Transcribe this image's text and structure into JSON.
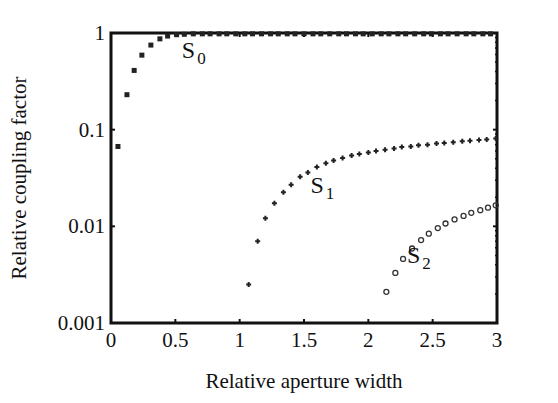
{
  "chart_data": {
    "type": "scatter",
    "title": "",
    "xlabel": "Relative aperture width",
    "ylabel": "Relative coupling factor",
    "xlim": [
      0,
      3
    ],
    "ylim": [
      0.001,
      1
    ],
    "yscale": "log",
    "grid": false,
    "legend": "inline labels",
    "x_ticks": [
      "0",
      "0.5",
      "1",
      "1.5",
      "2",
      "2.5",
      "3"
    ],
    "y_ticks": [
      "0.001",
      "0.01",
      "0.1",
      "1"
    ],
    "annotations": [
      {
        "text": "S",
        "sub": "0",
        "x": 0.55,
        "y": 0.55
      },
      {
        "text": "S",
        "sub": "1",
        "x": 1.55,
        "y": 0.022
      },
      {
        "text": "S",
        "sub": "2",
        "x": 2.3,
        "y": 0.0042
      }
    ],
    "series": [
      {
        "name": "S0",
        "marker": "x",
        "x": [
          0.054,
          0.124,
          0.18,
          0.24,
          0.31,
          0.38,
          0.44,
          0.51,
          0.57,
          0.64,
          0.71,
          0.77,
          0.84,
          0.9,
          0.97,
          1.04,
          1.1,
          1.17,
          1.24,
          1.3,
          1.37,
          1.43,
          1.5,
          1.57,
          1.63,
          1.7,
          1.77,
          1.83,
          1.9,
          1.96,
          2.03,
          2.1,
          2.16,
          2.23,
          2.29,
          2.36,
          2.43,
          2.49,
          2.56,
          2.62,
          2.69,
          2.76,
          2.82,
          2.89,
          2.95
        ],
        "y": [
          0.067,
          0.23,
          0.41,
          0.59,
          0.75,
          0.87,
          0.93,
          0.96,
          0.97,
          0.98,
          0.98,
          0.98,
          0.98,
          0.98,
          0.98,
          0.98,
          0.98,
          0.98,
          0.98,
          0.98,
          0.98,
          0.98,
          0.98,
          0.98,
          0.98,
          0.98,
          0.98,
          0.98,
          0.98,
          0.98,
          0.98,
          0.98,
          0.98,
          0.98,
          0.98,
          0.98,
          0.98,
          0.98,
          0.98,
          0.98,
          0.98,
          0.98,
          0.98,
          0.98,
          0.98
        ]
      },
      {
        "name": "S1",
        "marker": "+",
        "x": [
          1.07,
          1.14,
          1.2,
          1.27,
          1.34,
          1.4,
          1.47,
          1.53,
          1.6,
          1.67,
          1.73,
          1.8,
          1.87,
          1.93,
          2.0,
          2.06,
          2.13,
          2.2,
          2.26,
          2.33,
          2.39,
          2.46,
          2.53,
          2.59,
          2.66,
          2.73,
          2.79,
          2.86,
          2.92,
          2.99
        ],
        "y": [
          0.0025,
          0.007,
          0.0121,
          0.0173,
          0.0225,
          0.027,
          0.0326,
          0.036,
          0.041,
          0.045,
          0.048,
          0.051,
          0.054,
          0.056,
          0.058,
          0.06,
          0.062,
          0.064,
          0.066,
          0.067,
          0.069,
          0.07,
          0.072,
          0.073,
          0.074,
          0.076,
          0.077,
          0.078,
          0.079,
          0.081
        ]
      },
      {
        "name": "S2",
        "marker": "o",
        "x": [
          2.14,
          2.21,
          2.27,
          2.34,
          2.41,
          2.47,
          2.54,
          2.6,
          2.67,
          2.74,
          2.8,
          2.87,
          2.93,
          2.99
        ],
        "y": [
          0.0021,
          0.0033,
          0.0046,
          0.0059,
          0.0072,
          0.0084,
          0.0096,
          0.0107,
          0.0118,
          0.0128,
          0.0138,
          0.0147,
          0.0156,
          0.0165
        ]
      }
    ]
  }
}
